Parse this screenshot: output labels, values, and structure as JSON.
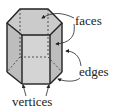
{
  "diagram": {
    "labels": {
      "faces": "faces",
      "edges": "edges",
      "vertices": "vertices"
    },
    "colors": {
      "fill": "#c8c8c8",
      "top_fill": "#cfcfcf",
      "front_fill": "#d6d6d6",
      "stroke": "#222222",
      "background": "#ffffff"
    }
  }
}
